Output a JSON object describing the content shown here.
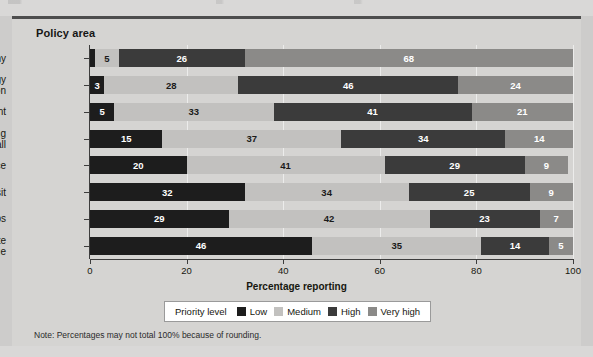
{
  "figure": {
    "plot_title": "Policy area",
    "note": "Note: Percentages may not total 100% because of rounding."
  },
  "legend": {
    "title": "Priority level",
    "items": [
      {
        "label": "Low",
        "color": "#1d1d1d"
      },
      {
        "label": "Medium",
        "color": "#c2c1bf"
      },
      {
        "label": "High",
        "color": "#3b3b3b"
      },
      {
        "label": "Very high",
        "color": "#8b8a88"
      }
    ]
  },
  "chart_data": {
    "type": "bar",
    "orientation": "horizontal",
    "stacked": true,
    "title": "Policy area",
    "xlabel": "Percentage reporting",
    "ylabel": "Policy area",
    "xlim": [
      0,
      100
    ],
    "xticks": [
      0,
      20,
      40,
      60,
      80,
      100
    ],
    "xticklabels": [
      "0",
      "20",
      "40",
      "60",
      "80",
      "100"
    ],
    "grid": true,
    "legend_position": "bottom",
    "legend_title": "Priority level",
    "note": "Note: Percentages may not total 100% because of rounding.",
    "categories": [
      "Economy",
      "Energy conservation",
      "Environment",
      "Housing for all",
      "Social justice",
      "Public transit",
      "Green jobs",
      "Climate change"
    ],
    "category_lines": [
      [
        "Economy"
      ],
      [
        "Energy",
        "conservation"
      ],
      [
        "Environment"
      ],
      [
        "Housing",
        "for all"
      ],
      [
        "Social justice"
      ],
      [
        "Public transit"
      ],
      [
        "Green jobs"
      ],
      [
        "Climate",
        "change"
      ]
    ],
    "series": [
      {
        "name": "Low",
        "color": "#1d1d1d",
        "values": [
          1,
          3,
          5,
          15,
          20,
          32,
          29,
          46
        ]
      },
      {
        "name": "Medium",
        "color": "#c2c1bf",
        "values": [
          5,
          28,
          33,
          37,
          41,
          34,
          42,
          35
        ]
      },
      {
        "name": "High",
        "color": "#3b3b3b",
        "values": [
          26,
          46,
          41,
          34,
          29,
          25,
          23,
          14
        ]
      },
      {
        "name": "Very high",
        "color": "#8b8a88",
        "values": [
          68,
          24,
          21,
          14,
          9,
          9,
          7,
          5
        ]
      }
    ]
  }
}
